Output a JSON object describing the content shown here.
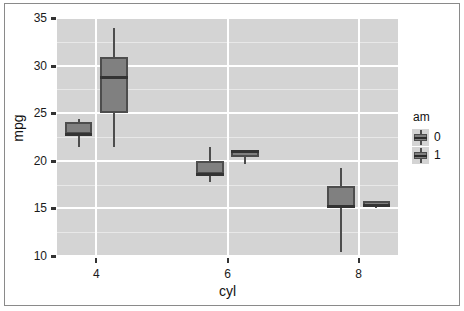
{
  "chart_data": {
    "type": "box",
    "title": "",
    "xlabel": "cyl",
    "ylabel": "mpg",
    "xlim": [
      3.4,
      8.6
    ],
    "ylim": [
      10,
      35
    ],
    "y_ticks": [
      10,
      15,
      20,
      25,
      30,
      35
    ],
    "x_ticks": [
      4,
      6,
      8
    ],
    "grid": "major-white-minor-light",
    "legend": {
      "title": "am",
      "position": "right",
      "entries": [
        {
          "label": "0",
          "fill": "#808080"
        },
        {
          "label": "1",
          "fill": "#808080"
        }
      ]
    },
    "categories": [
      "4",
      "6",
      "8"
    ],
    "groups": [
      "0",
      "1"
    ],
    "boxes": [
      {
        "name": "cyl-4-am-0",
        "cyl": 4,
        "am": "0",
        "min": 21.5,
        "q1": 22.8,
        "median": 22.8,
        "q3": 24.05,
        "max": 24.4
      },
      {
        "name": "cyl-4-am-1",
        "cyl": 4,
        "am": "1",
        "min": 21.4,
        "q1": 25.05,
        "median": 28.85,
        "q3": 30.9,
        "max": 33.9
      },
      {
        "name": "cyl-6-am-0",
        "cyl": 6,
        "am": "0",
        "min": 17.8,
        "q1": 18.65,
        "median": 18.65,
        "q3": 19.95,
        "max": 21.4
      },
      {
        "name": "cyl-6-am-1",
        "cyl": 6,
        "am": "1",
        "min": 19.7,
        "q1": 20.35,
        "median": 21.0,
        "q3": 21.0,
        "max": 21.0
      },
      {
        "name": "cyl-8-am-0",
        "cyl": 8,
        "am": "0",
        "min": 10.4,
        "q1": 15.05,
        "median": 15.2,
        "q3": 17.4,
        "max": 19.2
      },
      {
        "name": "cyl-8-am-1",
        "cyl": 8,
        "am": "1",
        "min": 15.0,
        "q1": 15.1,
        "median": 15.4,
        "q3": 15.8,
        "max": 15.8
      }
    ]
  },
  "axes": {
    "y_tick_labels": [
      "35",
      "30",
      "25",
      "20",
      "15",
      "10"
    ],
    "x_tick_labels": [
      "4",
      "6",
      "8"
    ],
    "x_title": "cyl",
    "y_title": "mpg"
  },
  "legend": {
    "title": "am",
    "items": [
      "0",
      "1"
    ]
  },
  "colors": {
    "panel_background": "#d4d4d4",
    "grid_major": "#ffffff",
    "grid_minor": "#e8e8e8",
    "box_fill": "#808080",
    "box_stroke": "#4d4d4d",
    "median": "#333333",
    "text": "#111111"
  }
}
